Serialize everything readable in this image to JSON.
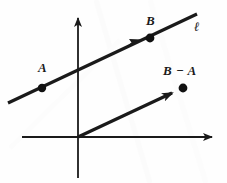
{
  "figure": {
    "background_color": "#fefefe",
    "ink_color": "#1a1a1a",
    "width": 227,
    "height": 183
  },
  "labels": {
    "point_a": "A",
    "point_b": "B",
    "difference_vector": "B − A",
    "line_name": "ℓ"
  },
  "axes": {
    "x_axis": {
      "name": "horizontal-axis",
      "start": [
        22,
        137
      ],
      "end": [
        216,
        137
      ],
      "arrow_at_end": true
    },
    "y_axis": {
      "name": "vertical-axis",
      "start": [
        78,
        178
      ],
      "end": [
        78,
        13
      ],
      "arrow_at_end": true
    },
    "origin": [
      78,
      137
    ]
  },
  "geometry": {
    "line_l": {
      "name": "line-l",
      "start": [
        8,
        103
      ],
      "end": [
        197,
        14
      ],
      "arrowhead_at": [
        140,
        41
      ],
      "stroke_width": 3.2
    },
    "vector_bma": {
      "name": "vector-b-minus-a",
      "start": [
        78,
        137
      ],
      "end": [
        179,
        90
      ],
      "arrow_at_end": true,
      "stroke_width": 3.2
    },
    "points": [
      {
        "name": "point-a-dot",
        "cx": 42,
        "cy": 88,
        "r": 4.2
      },
      {
        "name": "point-b-dot",
        "cx": 150,
        "cy": 38,
        "r": 4.4
      },
      {
        "name": "point-b-minus-a-dot",
        "cx": 183,
        "cy": 88,
        "r": 4.4
      }
    ]
  }
}
